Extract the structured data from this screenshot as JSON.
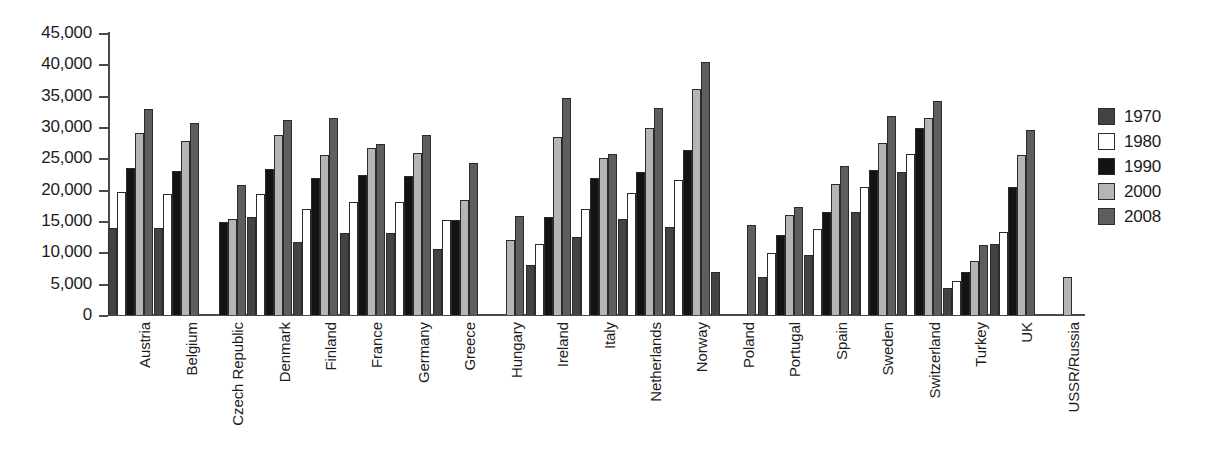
{
  "chart_data": {
    "type": "bar",
    "title": "",
    "xlabel": "",
    "ylabel": "",
    "ylim": [
      0,
      45000
    ],
    "ytick_step": 5000,
    "grid": false,
    "legend_position": "right",
    "yticks": [
      "45,000",
      "40,000",
      "35,000",
      "30,000",
      "25,000",
      "20,000",
      "15,000",
      "10,000",
      "5,000",
      "0"
    ],
    "ytick_values": [
      45000,
      40000,
      35000,
      30000,
      25000,
      20000,
      15000,
      10000,
      5000,
      0
    ],
    "categories": [
      "Austria",
      "Belgium",
      "Czech Republic",
      "Denmark",
      "Finland",
      "France",
      "Germany",
      "Greece",
      "Hungary",
      "Ireland",
      "Italy",
      "Netherlands",
      "Norway",
      "Poland",
      "Portugal",
      "Spain",
      "Sweden",
      "Switzerland",
      "Turkey",
      "UK",
      "USSR/Russia"
    ],
    "series": [
      {
        "name": "1970",
        "color": "#434343",
        "values": [
          13900,
          13900,
          null,
          15700,
          11700,
          13100,
          13100,
          10500,
          null,
          8000,
          12400,
          15400,
          14000,
          6800,
          6100,
          9600,
          16400,
          22800,
          4300,
          11300,
          null
        ]
      },
      {
        "name": "1980",
        "color": "#ffffff",
        "values": [
          19600,
          19300,
          null,
          19300,
          16900,
          18100,
          18000,
          15200,
          null,
          11400,
          16900,
          19400,
          21500,
          null,
          9900,
          13800,
          20400,
          25700,
          5400,
          13200,
          null
        ]
      },
      {
        "name": "1990",
        "color": "#131313",
        "values": [
          23500,
          23000,
          14800,
          23300,
          21800,
          22300,
          22200,
          15200,
          null,
          15600,
          21800,
          22800,
          26300,
          null,
          12800,
          16400,
          23100,
          29800,
          6900,
          20400,
          null
        ]
      },
      {
        "name": "2000",
        "color": "#b5b5b5",
        "values": [
          29000,
          27800,
          15300,
          28800,
          25600,
          26700,
          25900,
          18400,
          12000,
          28400,
          25000,
          29900,
          36000,
          null,
          16000,
          20900,
          27400,
          31400,
          8600,
          25500,
          6100
        ]
      },
      {
        "name": "2008",
        "color": "#5e5e5e",
        "values": [
          32900,
          30700,
          20700,
          31100,
          31500,
          27300,
          28700,
          24200,
          15800,
          34700,
          25700,
          33000,
          40300,
          14400,
          17300,
          23700,
          31800,
          34200,
          11200,
          29500,
          null
        ]
      }
    ]
  },
  "legend": {
    "items": [
      {
        "label": "1970",
        "color": "#434343"
      },
      {
        "label": "1980",
        "color": "#ffffff"
      },
      {
        "label": "1990",
        "color": "#131313"
      },
      {
        "label": "2000",
        "color": "#b5b5b5"
      },
      {
        "label": "2008",
        "color": "#5e5e5e"
      }
    ]
  }
}
